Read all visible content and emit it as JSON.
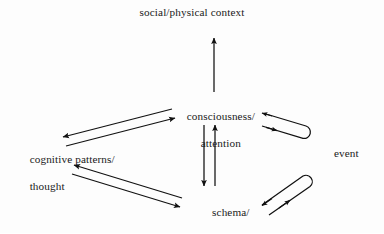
{
  "diagram": {
    "type": "cycle-diagram",
    "background_color": "#fdfdfd",
    "stroke_color": "#111111",
    "text_color": "#1a1a1a",
    "nodes": [
      {
        "id": "social-physical-context",
        "label": "social/physical context",
        "lines": [
          "social/physical context"
        ],
        "x": 192,
        "y": 14,
        "align": "center"
      },
      {
        "id": "consciousness-attention",
        "label": "consciousness/ attention",
        "lines": [
          "consciousness/",
          "attention"
        ],
        "x": 215,
        "y": 110,
        "align": "center"
      },
      {
        "id": "cognitive-patterns-thought",
        "label": "cognitive patterns/ thought",
        "lines": [
          "cognitive patterns/",
          "thought"
        ],
        "x": 80,
        "y": 153,
        "align": "left"
      },
      {
        "id": "schema-interpretation",
        "label": "schema/ interpretation",
        "lines": [
          "schema/",
          "interpretation"
        ],
        "x": 225,
        "y": 206,
        "align": "center"
      },
      {
        "id": "event",
        "label": "event",
        "lines": [
          "event"
        ],
        "x": 352,
        "y": 155,
        "align": "left"
      }
    ],
    "connections": [
      {
        "id": "consciousness-to-context",
        "from": "consciousness-attention",
        "to": "social-physical-context",
        "style": "single-arrow",
        "direction": "up"
      },
      {
        "id": "consciousness-to-cognitive",
        "from": "consciousness-attention",
        "to": "cognitive-patterns-thought",
        "style": "arrow",
        "direction": "down-left"
      },
      {
        "id": "cognitive-to-consciousness",
        "from": "cognitive-patterns-thought",
        "to": "consciousness-attention",
        "style": "arrow",
        "direction": "up-right"
      },
      {
        "id": "schema-to-cognitive",
        "from": "schema-interpretation",
        "to": "cognitive-patterns-thought",
        "style": "arrow",
        "direction": "up-left"
      },
      {
        "id": "cognitive-to-schema",
        "from": "cognitive-patterns-thought",
        "to": "schema-interpretation",
        "style": "arrow",
        "direction": "down-right"
      },
      {
        "id": "consciousness-to-schema",
        "from": "consciousness-attention",
        "to": "schema-interpretation",
        "style": "arrow",
        "direction": "down"
      },
      {
        "id": "schema-to-consciousness",
        "from": "schema-interpretation",
        "to": "consciousness-attention",
        "style": "arrow",
        "direction": "up"
      },
      {
        "id": "event-consciousness-loop",
        "from": "event",
        "to": "consciousness-attention",
        "style": "u-turn-loop",
        "direction": "bidirectional"
      },
      {
        "id": "event-schema-loop",
        "from": "event",
        "to": "schema-interpretation",
        "style": "u-turn-loop",
        "direction": "bidirectional"
      }
    ]
  }
}
